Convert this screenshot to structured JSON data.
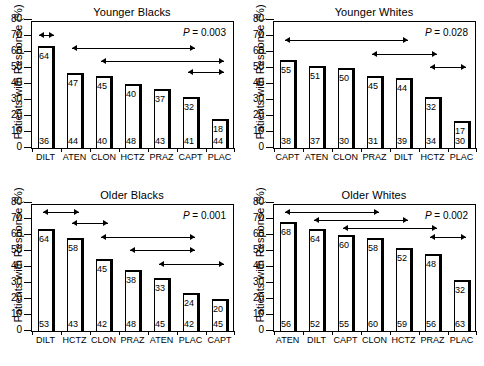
{
  "figure": {
    "ylabel": "Patients with Response (%)",
    "y_ticks": [
      0,
      10,
      20,
      30,
      40,
      50,
      60,
      70,
      80
    ],
    "y_min": 0,
    "y_max": 80,
    "p_prefix": "P",
    "p_equals": " = "
  },
  "chart_data": {
    "type": "bar",
    "xlabel": "",
    "ylabel": "Patients with Response (%)",
    "ylim": [
      0,
      80
    ],
    "yticks": [
      0,
      10,
      20,
      30,
      40,
      50,
      60,
      70,
      80
    ],
    "grid": false,
    "legend": "none",
    "panels": [
      {
        "key": "younger_blacks",
        "title": "Younger Blacks",
        "p_value": "0.003",
        "categories": [
          "DILT",
          "ATEN",
          "CLON",
          "HCTZ",
          "PRAZ",
          "CAPT",
          "PLAC"
        ],
        "values": [
          64,
          47,
          45,
          40,
          37,
          32,
          18
        ],
        "n": [
          36,
          44,
          40,
          48,
          43,
          41,
          44
        ],
        "arrows": [
          {
            "from": 0,
            "to": 0,
            "level": 70
          },
          {
            "from": 1,
            "to": 5,
            "level": 62
          },
          {
            "from": 2,
            "to": 6,
            "level": 54
          },
          {
            "from": 5,
            "to": 6,
            "level": 47
          }
        ]
      },
      {
        "key": "younger_whites",
        "title": "Younger Whites",
        "p_value": "0.028",
        "categories": [
          "CAPT",
          "ATEN",
          "CLON",
          "PRAZ",
          "DILT",
          "HCTZ",
          "PLAC"
        ],
        "values": [
          55,
          51,
          50,
          45,
          44,
          32,
          17
        ],
        "n": [
          38,
          37,
          30,
          31,
          39,
          34,
          30
        ],
        "arrows": [
          {
            "from": 0,
            "to": 4,
            "level": 67
          },
          {
            "from": 3,
            "to": 5,
            "level": 58
          },
          {
            "from": 5,
            "to": 6,
            "level": 50
          }
        ]
      },
      {
        "key": "older_blacks",
        "title": "Older Blacks",
        "p_value": "0.001",
        "categories": [
          "DILT",
          "HCTZ",
          "CLON",
          "PRAZ",
          "ATEN",
          "PLAC",
          "CAPT"
        ],
        "values": [
          64,
          58,
          45,
          38,
          33,
          24,
          20
        ],
        "n": [
          53,
          43,
          42,
          48,
          45,
          42,
          45
        ],
        "arrows": [
          {
            "from": 0,
            "to": 1,
            "level": 74
          },
          {
            "from": 1,
            "to": 2,
            "level": 67
          },
          {
            "from": 2,
            "to": 5,
            "level": 58
          },
          {
            "from": 3,
            "to": 5,
            "level": 50
          },
          {
            "from": 4,
            "to": 6,
            "level": 41
          }
        ]
      },
      {
        "key": "older_whites",
        "title": "Older Whites",
        "p_value": "0.002",
        "categories": [
          "ATEN",
          "DILT",
          "CAPT",
          "CLON",
          "HCTZ",
          "PRAZ",
          "PLAC"
        ],
        "values": [
          68,
          64,
          60,
          58,
          52,
          48,
          32
        ],
        "n": [
          56,
          52,
          55,
          60,
          59,
          56,
          63
        ],
        "arrows": [
          {
            "from": 0,
            "to": 3,
            "level": 74
          },
          {
            "from": 1,
            "to": 4,
            "level": 69
          },
          {
            "from": 2,
            "to": 5,
            "level": 64
          },
          {
            "from": 5,
            "to": 6,
            "level": 58
          }
        ]
      }
    ]
  }
}
